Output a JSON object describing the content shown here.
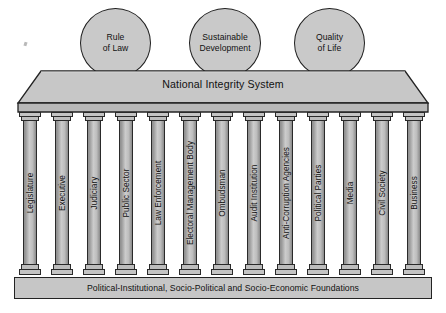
{
  "diagram": {
    "title": "National Integrity System",
    "roof_label": "National Integrity System",
    "foundation_label": "Political-Institutional, Socio-Political and Socio-Economic Foundations",
    "colors": {
      "fill_light": "#c9c9c9",
      "fill_roof": "#c4c4c4",
      "fill_pillar": "#cccccc",
      "outline": "#232323",
      "background": "#ffffff",
      "text": "#111111"
    },
    "goals": [
      {
        "id": "rule-of-law",
        "line1": "Rule",
        "line2": "of Law",
        "x": 80,
        "y": 8,
        "w": 71,
        "h": 70
      },
      {
        "id": "sustainable-development",
        "line1": "Sustainable",
        "line2": "Development",
        "x": 189,
        "y": 8,
        "w": 72,
        "h": 70
      },
      {
        "id": "quality-of-life",
        "line1": "Quality",
        "line2": "of Life",
        "x": 294,
        "y": 8,
        "w": 71,
        "h": 70
      }
    ],
    "pillars": [
      {
        "id": "legislature",
        "label": "Legislature",
        "x": 19
      },
      {
        "id": "executive",
        "label": "Executive",
        "x": 51
      },
      {
        "id": "judiciary",
        "label": "Judiciary",
        "x": 83
      },
      {
        "id": "public-sector",
        "label": "Public Sector",
        "x": 115
      },
      {
        "id": "law-enforcement",
        "label": "Law Enforcement",
        "x": 147
      },
      {
        "id": "electoral-management-body",
        "label": "Electoral Management Body",
        "x": 179
      },
      {
        "id": "ombudsman",
        "label": "Ombudsman",
        "x": 211
      },
      {
        "id": "audit-institution",
        "label": "Audit Institution",
        "x": 243
      },
      {
        "id": "anti-corruption-agencies",
        "label": "Anti-Corruption Agencies",
        "x": 275
      },
      {
        "id": "political-parties",
        "label": "Political Parties",
        "x": 307
      },
      {
        "id": "media",
        "label": "Media",
        "x": 339
      },
      {
        "id": "civil-society",
        "label": "Civil Society",
        "x": 371
      },
      {
        "id": "business",
        "label": "Business",
        "x": 403
      }
    ]
  }
}
